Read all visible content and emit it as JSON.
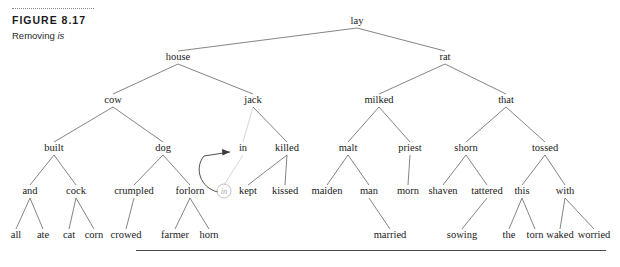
{
  "figure": {
    "label": "FIGURE 8.17",
    "description_prefix": "Removing ",
    "description_italic": "is"
  },
  "tree": {
    "type": "syntax-tree",
    "root": "lay",
    "nodes": [
      {
        "id": "lay",
        "label": "lay",
        "x": 357,
        "y": 24,
        "depth": 0
      },
      {
        "id": "house",
        "label": "house",
        "x": 178,
        "y": 60,
        "depth": 1
      },
      {
        "id": "rat",
        "label": "rat",
        "x": 445,
        "y": 60,
        "depth": 1
      },
      {
        "id": "cow",
        "label": "cow",
        "x": 113,
        "y": 103,
        "depth": 2
      },
      {
        "id": "jack",
        "label": "jack",
        "x": 253,
        "y": 103,
        "depth": 2
      },
      {
        "id": "milked",
        "label": "milked",
        "x": 379,
        "y": 103,
        "depth": 2
      },
      {
        "id": "that",
        "label": "that",
        "x": 506,
        "y": 103,
        "depth": 2
      },
      {
        "id": "built",
        "label": "built",
        "x": 54,
        "y": 151,
        "depth": 3
      },
      {
        "id": "dog",
        "label": "dog",
        "x": 163,
        "y": 151,
        "depth": 3
      },
      {
        "id": "in",
        "label": "in",
        "x": 243,
        "y": 151,
        "depth": 3
      },
      {
        "id": "killed",
        "label": "killed",
        "x": 287,
        "y": 151,
        "depth": 3
      },
      {
        "id": "malt",
        "label": "malt",
        "x": 348,
        "y": 151,
        "depth": 3
      },
      {
        "id": "priest",
        "label": "priest",
        "x": 410,
        "y": 151,
        "depth": 3
      },
      {
        "id": "shorn",
        "label": "shorn",
        "x": 466,
        "y": 151,
        "depth": 3
      },
      {
        "id": "tossed",
        "label": "tossed",
        "x": 545,
        "y": 151,
        "depth": 3
      },
      {
        "id": "and",
        "label": "and",
        "x": 30,
        "y": 194,
        "depth": 4
      },
      {
        "id": "cock",
        "label": "cock",
        "x": 76,
        "y": 194,
        "depth": 4
      },
      {
        "id": "crumpled",
        "label": "crumpled",
        "x": 134,
        "y": 194,
        "depth": 4
      },
      {
        "id": "forlorn",
        "label": "forlorn",
        "x": 190,
        "y": 194,
        "depth": 4
      },
      {
        "id": "trace-in",
        "label": "in",
        "x": 224,
        "y": 194,
        "depth": 4,
        "trace": true
      },
      {
        "id": "kept",
        "label": "kept",
        "x": 248,
        "y": 194,
        "depth": 4
      },
      {
        "id": "kissed",
        "label": "kissed",
        "x": 285,
        "y": 194,
        "depth": 4
      },
      {
        "id": "maiden",
        "label": "maiden",
        "x": 327,
        "y": 194,
        "depth": 4
      },
      {
        "id": "man",
        "label": "man",
        "x": 369,
        "y": 194,
        "depth": 4
      },
      {
        "id": "morn",
        "label": "morn",
        "x": 408,
        "y": 194,
        "depth": 4
      },
      {
        "id": "shaven",
        "label": "shaven",
        "x": 443,
        "y": 194,
        "depth": 4
      },
      {
        "id": "tattered",
        "label": "tattered",
        "x": 487,
        "y": 194,
        "depth": 4
      },
      {
        "id": "this",
        "label": "this",
        "x": 522,
        "y": 194,
        "depth": 4
      },
      {
        "id": "with",
        "label": "with",
        "x": 565,
        "y": 194,
        "depth": 4
      },
      {
        "id": "all",
        "label": "all",
        "x": 16,
        "y": 238,
        "depth": 5
      },
      {
        "id": "ate",
        "label": "ate",
        "x": 43,
        "y": 238,
        "depth": 5
      },
      {
        "id": "cat",
        "label": "cat",
        "x": 69,
        "y": 238,
        "depth": 5
      },
      {
        "id": "corn",
        "label": "corn",
        "x": 94,
        "y": 238,
        "depth": 5
      },
      {
        "id": "crowed",
        "label": "crowed",
        "x": 126,
        "y": 238,
        "depth": 5
      },
      {
        "id": "farmer",
        "label": "farmer",
        "x": 175,
        "y": 238,
        "depth": 5
      },
      {
        "id": "horn",
        "label": "horn",
        "x": 209,
        "y": 238,
        "depth": 5
      },
      {
        "id": "married",
        "label": "married",
        "x": 390,
        "y": 238,
        "depth": 5
      },
      {
        "id": "sowing",
        "label": "sowing",
        "x": 462,
        "y": 238,
        "depth": 5
      },
      {
        "id": "the",
        "label": "the",
        "x": 509,
        "y": 238,
        "depth": 5
      },
      {
        "id": "torn",
        "label": "torn",
        "x": 535,
        "y": 238,
        "depth": 5
      },
      {
        "id": "waked",
        "label": "waked",
        "x": 560,
        "y": 238,
        "depth": 5
      },
      {
        "id": "worried",
        "label": "worried",
        "x": 594,
        "y": 238,
        "depth": 5
      }
    ],
    "edges": [
      {
        "from": "lay",
        "to": "house"
      },
      {
        "from": "lay",
        "to": "rat"
      },
      {
        "from": "house",
        "to": "cow"
      },
      {
        "from": "house",
        "to": "jack"
      },
      {
        "from": "rat",
        "to": "milked"
      },
      {
        "from": "rat",
        "to": "that"
      },
      {
        "from": "cow",
        "to": "built"
      },
      {
        "from": "cow",
        "to": "dog"
      },
      {
        "from": "jack",
        "to": "in",
        "faint": true
      },
      {
        "from": "jack",
        "to": "killed"
      },
      {
        "from": "milked",
        "to": "malt"
      },
      {
        "from": "milked",
        "to": "priest"
      },
      {
        "from": "that",
        "to": "shorn"
      },
      {
        "from": "that",
        "to": "tossed"
      },
      {
        "from": "built",
        "to": "and"
      },
      {
        "from": "built",
        "to": "cock"
      },
      {
        "from": "dog",
        "to": "crumpled"
      },
      {
        "from": "dog",
        "to": "forlorn"
      },
      {
        "from": "in",
        "to": "trace-in",
        "faint": true
      },
      {
        "from": "killed",
        "to": "kept"
      },
      {
        "from": "killed",
        "to": "kissed"
      },
      {
        "from": "malt",
        "to": "maiden"
      },
      {
        "from": "malt",
        "to": "man"
      },
      {
        "from": "priest",
        "to": "morn"
      },
      {
        "from": "shorn",
        "to": "shaven"
      },
      {
        "from": "shorn",
        "to": "tattered"
      },
      {
        "from": "tossed",
        "to": "this"
      },
      {
        "from": "tossed",
        "to": "with"
      },
      {
        "from": "and",
        "to": "all"
      },
      {
        "from": "and",
        "to": "ate"
      },
      {
        "from": "cock",
        "to": "cat"
      },
      {
        "from": "cock",
        "to": "corn"
      },
      {
        "from": "crumpled",
        "to": "crowed"
      },
      {
        "from": "forlorn",
        "to": "farmer"
      },
      {
        "from": "forlorn",
        "to": "horn"
      },
      {
        "from": "man",
        "to": "married"
      },
      {
        "from": "tattered",
        "to": "sowing"
      },
      {
        "from": "this",
        "to": "the"
      },
      {
        "from": "this",
        "to": "torn"
      },
      {
        "from": "with",
        "to": "waked"
      },
      {
        "from": "with",
        "to": "worried"
      }
    ],
    "movement_arrow": {
      "from": "trace-in",
      "to": "in",
      "path": "M 218 192 C 200 188 194 168 204 156 L 230 152",
      "arrowhead": "M 230 152 L 222 149 L 222.5 155.5 Z"
    }
  }
}
